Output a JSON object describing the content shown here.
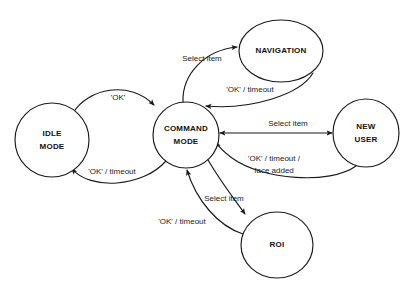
{
  "diagram": {
    "type": "state-machine-diagram",
    "background_color": "#ffffff",
    "stroke_color": "#1a1a1a",
    "nodes": [
      {
        "id": "idle",
        "label_line1": "IDLE",
        "label_line2": "MODE",
        "shape": "circle",
        "cx": 52,
        "cy": 140,
        "rx": 37,
        "ry": 37
      },
      {
        "id": "command",
        "label_line1": "COMMAND",
        "label_line2": "MODE",
        "shape": "circle",
        "cx": 186,
        "cy": 135,
        "rx": 33,
        "ry": 33
      },
      {
        "id": "navigation",
        "label_line1": "NAVIGATION",
        "label_line2": "",
        "shape": "ellipse",
        "cx": 281,
        "cy": 51,
        "rx": 42,
        "ry": 31
      },
      {
        "id": "newuser",
        "label_line1": "NEW",
        "label_line2": "USER",
        "shape": "ellipse",
        "cx": 366,
        "cy": 133,
        "rx": 33,
        "ry": 34
      },
      {
        "id": "roi",
        "label_line1": "ROI",
        "label_line2": "",
        "shape": "ellipse",
        "cx": 277,
        "cy": 245,
        "rx": 36,
        "ry": 33
      }
    ],
    "edges": [
      {
        "id": "idle-to-command",
        "from": "idle",
        "to": "command",
        "label": "'OK'",
        "label_x": 118,
        "label_y": 98
      },
      {
        "id": "command-to-idle",
        "from": "command",
        "to": "idle",
        "label": "'OK' / timeout",
        "label_x": 112,
        "label_y": 172
      },
      {
        "id": "command-to-navigation",
        "from": "command",
        "to": "navigation",
        "label": "Select item",
        "label_x": 202,
        "label_y": 59
      },
      {
        "id": "navigation-to-command",
        "from": "navigation",
        "to": "command",
        "label": "'OK' / timeout",
        "label_x": 250,
        "label_y": 90
      },
      {
        "id": "command-to-newuser",
        "from": "command",
        "to": "newuser",
        "label": "Select item",
        "label_x": 288,
        "label_y": 124
      },
      {
        "id": "newuser-to-command",
        "from": "newuser",
        "to": "command",
        "label_line1": "'OK' / timeout /",
        "label_line2": "face added",
        "label_x": 274,
        "label_y": 164
      },
      {
        "id": "command-to-roi",
        "from": "command",
        "to": "roi",
        "label": "Select item",
        "label_x": 224,
        "label_y": 199
      },
      {
        "id": "roi-to-command",
        "from": "roi",
        "to": "command",
        "label": "'OK' / timeout",
        "label_x": 182,
        "label_y": 222
      }
    ]
  }
}
